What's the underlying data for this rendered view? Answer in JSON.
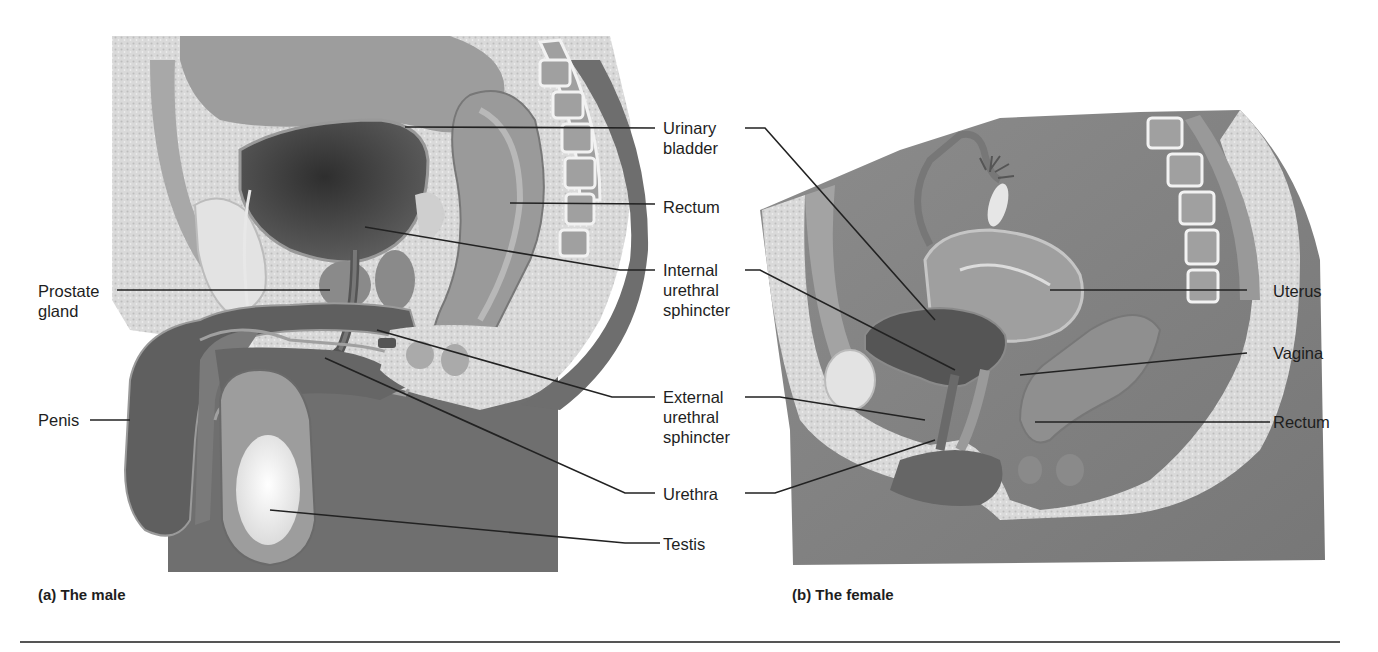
{
  "figure": {
    "panels": [
      {
        "id": "a",
        "caption": "(a)  The male"
      },
      {
        "id": "b",
        "caption": "(b)  The female"
      }
    ],
    "center_labels": {
      "urinary_bladder": [
        "Urinary",
        "bladder"
      ],
      "rectum": "Rectum",
      "internal_urethral_sphincter": [
        "Internal",
        "urethral",
        "sphincter"
      ],
      "external_urethral_sphincter": [
        "External",
        "urethral",
        "sphincter"
      ],
      "urethra": "Urethra",
      "testis": "Testis"
    },
    "male_left_labels": {
      "prostate_gland": [
        "Prostate",
        "gland"
      ],
      "penis": "Penis"
    },
    "female_right_labels": {
      "uterus": "Uterus",
      "vagina": "Vagina",
      "rectum": "Rectum"
    }
  },
  "colors": {
    "background": "#ffffff",
    "leader_line": "#222222",
    "tissue_dark": "#6e6e6e",
    "tissue_mid": "#9a9a9a",
    "tissue_light": "#c8c8c8",
    "bone_speckle": "#d8d8d8",
    "bladder": "#555555",
    "testis": "#f4f4f4",
    "rule": "#555555"
  }
}
